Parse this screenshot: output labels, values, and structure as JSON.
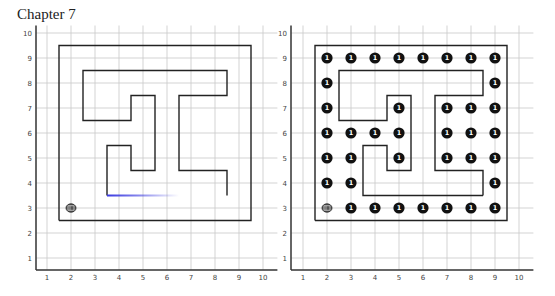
{
  "page": {
    "title": "Chapter 7"
  },
  "colors": {
    "wall": "#222222",
    "grid": "#c8c8c8",
    "token": "#111111",
    "trail": "#3a3ae0",
    "axis": "#333333"
  },
  "axes": {
    "x_ticks": [
      "1",
      "2",
      "3",
      "4",
      "5",
      "6",
      "7",
      "8",
      "9",
      "10"
    ],
    "y_ticks": [
      "1",
      "2",
      "3",
      "4",
      "5",
      "6",
      "7",
      "8",
      "9",
      "10"
    ]
  },
  "grids": [
    {
      "id": "left",
      "x_origin_px": 23,
      "y_origin_px": 283,
      "unit_px_x": 24,
      "unit_px_y": 25,
      "axis_x_px": 36,
      "axis_y_px": 270,
      "outer_wall": [
        [
          1.5,
          2.5
        ],
        [
          9.5,
          2.5
        ],
        [
          9.5,
          9.5
        ],
        [
          1.5,
          9.5
        ],
        [
          1.5,
          2.5
        ]
      ],
      "inner_wall": [
        [
          8.5,
          3.5
        ],
        [
          8.5,
          4.5
        ],
        [
          6.5,
          4.5
        ],
        [
          6.5,
          7.5
        ],
        [
          8.5,
          7.5
        ],
        [
          8.5,
          8.5
        ],
        [
          2.5,
          8.5
        ],
        [
          2.5,
          6.5
        ],
        [
          4.5,
          6.5
        ],
        [
          4.5,
          7.5
        ],
        [
          5.5,
          7.5
        ],
        [
          5.5,
          4.5
        ],
        [
          4.5,
          4.5
        ],
        [
          4.5,
          5.5
        ],
        [
          3.5,
          5.5
        ],
        [
          3.5,
          3.5
        ]
      ],
      "trail": {
        "from": [
          3.5,
          3.5
        ],
        "to": [
          6.5,
          3.5
        ],
        "color": "#3a3ae0"
      },
      "robot": {
        "icon": "robot-icon",
        "x": 2,
        "y": 3
      },
      "tokens": []
    },
    {
      "id": "right",
      "x_origin_px": 279,
      "y_origin_px": 283,
      "unit_px_x": 24,
      "unit_px_y": 25,
      "axis_x_px": 291,
      "axis_y_px": 270,
      "outer_wall": [
        [
          1.5,
          2.5
        ],
        [
          9.5,
          2.5
        ],
        [
          9.5,
          9.5
        ],
        [
          1.5,
          9.5
        ],
        [
          1.5,
          2.5
        ]
      ],
      "inner_wall": [
        [
          8.5,
          3.5
        ],
        [
          8.5,
          4.5
        ],
        [
          6.5,
          4.5
        ],
        [
          6.5,
          7.5
        ],
        [
          8.5,
          7.5
        ],
        [
          8.5,
          8.5
        ],
        [
          2.5,
          8.5
        ],
        [
          2.5,
          6.5
        ],
        [
          4.5,
          6.5
        ],
        [
          4.5,
          7.5
        ],
        [
          5.5,
          7.5
        ],
        [
          5.5,
          4.5
        ],
        [
          4.5,
          4.5
        ],
        [
          4.5,
          5.5
        ],
        [
          3.5,
          5.5
        ],
        [
          3.5,
          3.5
        ],
        [
          8.5,
          3.5
        ]
      ],
      "robot": {
        "icon": "robot-icon",
        "x": 2,
        "y": 3
      },
      "token_label": "1",
      "tokens": [
        [
          2,
          9
        ],
        [
          3,
          9
        ],
        [
          4,
          9
        ],
        [
          5,
          9
        ],
        [
          6,
          9
        ],
        [
          7,
          9
        ],
        [
          8,
          9
        ],
        [
          9,
          9
        ],
        [
          2,
          8
        ],
        [
          9,
          8
        ],
        [
          2,
          7
        ],
        [
          5,
          7
        ],
        [
          7,
          7
        ],
        [
          8,
          7
        ],
        [
          9,
          7
        ],
        [
          2,
          6
        ],
        [
          3,
          6
        ],
        [
          4,
          6
        ],
        [
          5,
          6
        ],
        [
          7,
          6
        ],
        [
          8,
          6
        ],
        [
          9,
          6
        ],
        [
          2,
          5
        ],
        [
          3,
          5
        ],
        [
          5,
          5
        ],
        [
          7,
          5
        ],
        [
          8,
          5
        ],
        [
          9,
          5
        ],
        [
          2,
          4
        ],
        [
          3,
          4
        ],
        [
          9,
          4
        ],
        [
          3,
          3
        ],
        [
          4,
          3
        ],
        [
          5,
          3
        ],
        [
          6,
          3
        ],
        [
          7,
          3
        ],
        [
          8,
          3
        ],
        [
          9,
          3
        ]
      ]
    }
  ]
}
